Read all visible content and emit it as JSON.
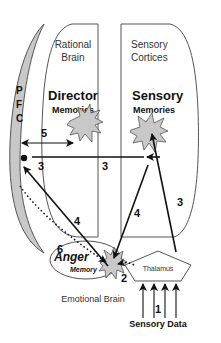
{
  "diagram": {
    "pfc": {
      "letters": [
        "P",
        "F",
        "C"
      ]
    },
    "rational_brain": {
      "title_line1": "Rational",
      "title_line2": "Brain",
      "memory_title": "Director",
      "memory_sub": "Memories"
    },
    "sensory_cortices": {
      "title_line1": "Sensory",
      "title_line2": "Cortices",
      "memory_title": "Sensory",
      "memory_sub": "Memories"
    },
    "emotional_brain": {
      "label": "Emotional Brain",
      "memory_title": "Anger",
      "memory_sub": "Memory"
    },
    "thalamus": {
      "label": "Thalamus"
    },
    "sensory_data": {
      "label": "Sensory Data"
    },
    "pathways": [
      {
        "id": "1",
        "label": "1",
        "from": "Sensory Data",
        "to": "Thalamus",
        "style": "solid"
      },
      {
        "id": "2",
        "label": "2",
        "from": "Thalamus",
        "to": "Anger Memory",
        "style": "dotted"
      },
      {
        "id": "3a",
        "label": "3",
        "from": "Thalamus",
        "to": "Sensory Memories",
        "style": "solid"
      },
      {
        "id": "3b",
        "label": "3",
        "from": "Sensory Memories",
        "to": "PFC",
        "style": "solid"
      },
      {
        "id": "3c",
        "label": "3",
        "from": "Director Memories",
        "to": "PFC",
        "style": "solid"
      },
      {
        "id": "4a",
        "label": "4",
        "from": "Sensory Memories",
        "to": "Anger Memory",
        "style": "solid"
      },
      {
        "id": "4b",
        "label": "4",
        "from": "Anger Memory",
        "to": "PFC",
        "style": "solid"
      },
      {
        "id": "5",
        "label": "5",
        "from": "PFC",
        "to": "Director Memories",
        "style": "double-headed"
      },
      {
        "id": "6",
        "label": "6",
        "from": "PFC",
        "to": "Anger Memory",
        "style": "dotted"
      }
    ]
  }
}
